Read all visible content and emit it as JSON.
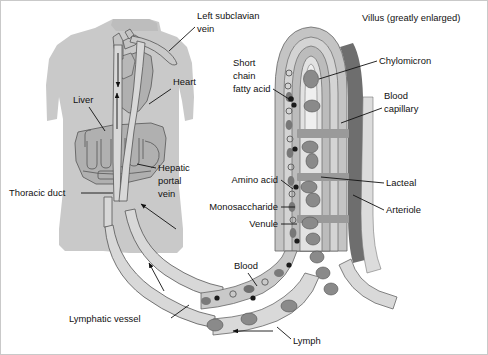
{
  "figure": {
    "title": "Villus (greatly enlarged)",
    "background_color": "#ffffff",
    "border_color": "#c9c9c9"
  },
  "colors": {
    "body_silhouette": "#c9c9c9",
    "organ_fill": "#b0b0b0",
    "vessel_light": "#d8d8d8",
    "vessel_mid": "#bdbdbd",
    "arteriole_dark": "#6e6e6e",
    "lacteal_fill": "#e2e2e2",
    "cell_dark": "#7a7a7a",
    "chylomicron": "#8a8a8a",
    "outline": "#555555",
    "leader_line": "#111111"
  },
  "labels": {
    "left_subclavian_vein": {
      "line1": "Left subclavian",
      "line2": "vein"
    },
    "heart": "Heart",
    "liver": "Liver",
    "hepatic_portal_vein": {
      "line1": "Hepatic",
      "line2": "portal",
      "line3": "vein"
    },
    "thoracic_duct": "Thoracic duct",
    "lymphatic_vessel": "Lymphatic vessel",
    "short_chain_fatty_acid": {
      "line1": "Short",
      "line2": "chain",
      "line3": "fatty acid"
    },
    "villus_title": "Villus (greatly enlarged)",
    "chylomicron": "Chylomicron",
    "blood_capillary": {
      "line1": "Blood",
      "line2": "capillary"
    },
    "amino_acid": "Amino acid",
    "monosaccharide": "Monosaccharide",
    "venule": "Venule",
    "lacteal": "Lacteal",
    "arteriole": "Arteriole",
    "blood": "Blood",
    "lymph": "Lymph"
  },
  "structures": {
    "body": "human torso silhouette",
    "villus": "finger-like intestinal projection with nested layers",
    "flow_arrows": [
      {
        "name": "downward-flow-arrow",
        "direction": "down"
      },
      {
        "name": "upward-flow-arrow",
        "direction": "up"
      },
      {
        "name": "portal-inflow-arrow",
        "direction": "up-left"
      },
      {
        "name": "lymph-inflow-arrow",
        "direction": "up-left"
      },
      {
        "name": "lymph-flow-arrow",
        "direction": "left"
      }
    ]
  }
}
